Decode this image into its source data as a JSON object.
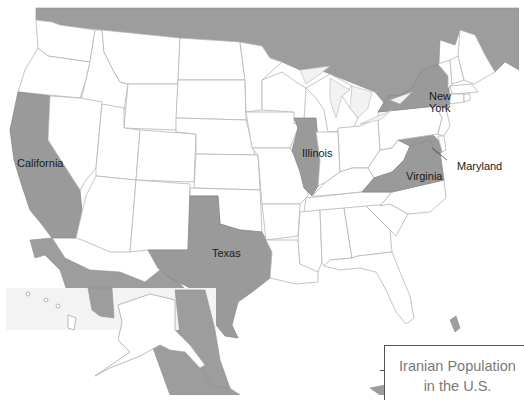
{
  "map": {
    "title_line1": "Iranian Population",
    "title_line2": "in the U.S.",
    "colors": {
      "highlighted_state": "#9a9a9a",
      "foreign_land": "#9d9d9d",
      "state_fill": "#ffffff",
      "border": "#b5b5b5",
      "legend_text": "#7a7a7a"
    },
    "highlighted_states": [
      "California",
      "Texas",
      "Illinois",
      "New York",
      "Virginia",
      "Maryland"
    ],
    "labels": {
      "california": "California",
      "texas": "Texas",
      "illinois": "Illinois",
      "new_york_1": "New",
      "new_york_2": "York",
      "virginia": "Virginia",
      "maryland": "Maryland"
    }
  }
}
